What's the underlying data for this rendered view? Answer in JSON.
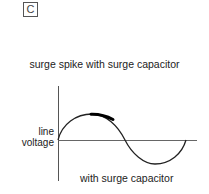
{
  "panel": {
    "label": "C"
  },
  "diagram": {
    "title": "surge spike with surge capacitor",
    "y_axis_label_line1": "line",
    "y_axis_label_line2": "voltage",
    "caption": "with surge capacitor",
    "waveform": "sine",
    "highlight": "surge spike (thick segment near positive peak, suppressed)",
    "colors": {
      "line": "#222222",
      "axis": "#555555",
      "spike": "#000000"
    }
  }
}
